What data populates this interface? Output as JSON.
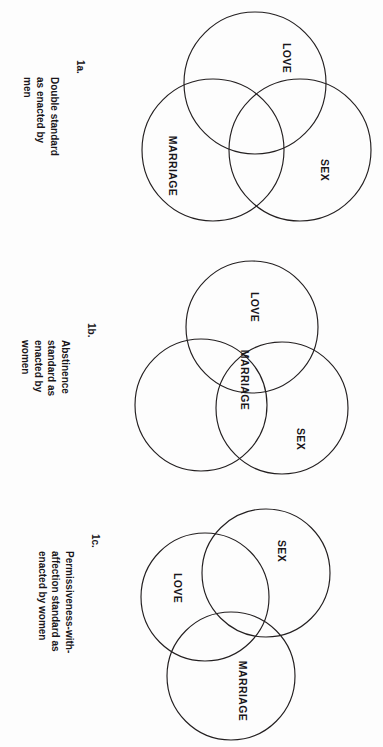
{
  "figure": {
    "background_color": "#fdfdfd",
    "line_color": "#231f20",
    "text_color": "#19161a",
    "orientation_note": "page rotated 90 degrees"
  },
  "panels": [
    {
      "id": "panel-1a",
      "caption_number": "1a.",
      "caption_text": "Double standard\nas enacted by\nmen",
      "circles": [
        {
          "name": "LOVE",
          "label": "LOVE"
        },
        {
          "name": "SEX",
          "label": "SEX"
        },
        {
          "name": "MARRIAGE",
          "label": "MARRIAGE"
        }
      ]
    },
    {
      "id": "panel-1b",
      "caption_number": "1b.",
      "caption_text": "Abstinence\nstandard as\nenacted by\nwomen",
      "circles": [
        {
          "name": "LOVE",
          "label": "LOVE"
        },
        {
          "name": "SEX",
          "label": "SEX"
        },
        {
          "name": "MARRIAGE",
          "label": "MARRIAGE"
        }
      ]
    },
    {
      "id": "panel-1c",
      "caption_number": "1c.",
      "caption_text": "Permissiveness-with-\naffection standard as\nenacted by women",
      "circles": [
        {
          "name": "LOVE",
          "label": "LOVE"
        },
        {
          "name": "SEX",
          "label": "SEX"
        },
        {
          "name": "MARRIAGE",
          "label": "MARRIAGE"
        }
      ]
    }
  ]
}
